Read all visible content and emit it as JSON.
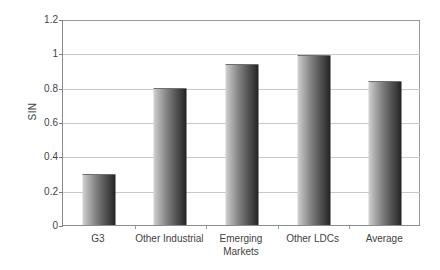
{
  "chart_data": {
    "type": "bar",
    "title": "",
    "xlabel": "",
    "ylabel": "SIN",
    "categories": [
      "G3",
      "Other Industrial",
      "Emerging Markets",
      "Other LDCs",
      "Average"
    ],
    "category_lines": [
      [
        "G3"
      ],
      [
        "Other Industrial"
      ],
      [
        "Emerging",
        "Markets"
      ],
      [
        "Other LDCs"
      ],
      [
        "Average"
      ]
    ],
    "values": [
      0.3,
      0.8,
      0.94,
      0.99,
      0.84
    ],
    "ylim": [
      0,
      1.2
    ],
    "ytick_labels": [
      "0",
      "0.2",
      "0.4",
      "0.6",
      "0.8",
      "1",
      "1.2"
    ],
    "ytick_values": [
      0,
      0.2,
      0.4,
      0.6,
      0.8,
      1.0,
      1.2
    ],
    "grid": true,
    "legend": false,
    "legend_position": "none",
    "bar_fill": "gradient-gray",
    "colors": {
      "background": "#ffffff",
      "gridline": "#c9c9c9",
      "axis": "#8c8c8c",
      "text": "#3f3f3f",
      "bar_light": "#d2d2d2",
      "bar_dark": "#1d1d1d"
    }
  }
}
